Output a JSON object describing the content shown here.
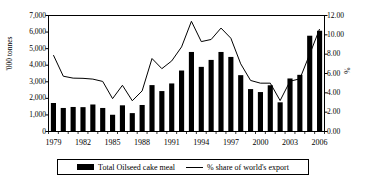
{
  "chart_data": {
    "type": "bar",
    "title": "",
    "subtitle": "",
    "xlabel": "",
    "ylabel": "'000 tonnes",
    "y2label": "%",
    "grid": false,
    "legend_position": "bottom",
    "x": [
      1979,
      1980,
      1981,
      1982,
      1983,
      1984,
      1985,
      1986,
      1987,
      1988,
      1989,
      1990,
      1991,
      1992,
      1993,
      1994,
      1995,
      1996,
      1997,
      1998,
      1999,
      2000,
      2001,
      2002,
      2003,
      2004,
      2005,
      2006
    ],
    "xtick_labels": [
      "1979",
      "1982",
      "1985",
      "1988",
      "1991",
      "1994",
      "1997",
      "2000",
      "2003",
      "2006"
    ],
    "xtick_values": [
      1979,
      1982,
      1985,
      1988,
      1991,
      1994,
      1997,
      2000,
      2003,
      2006
    ],
    "ylim": [
      0,
      7000
    ],
    "ytick_labels": [
      "0",
      "1,000",
      "2,000",
      "3,000",
      "4,000",
      "5,000",
      "6,000",
      "7,000"
    ],
    "ytick_values": [
      0,
      1000,
      2000,
      3000,
      4000,
      5000,
      6000,
      7000
    ],
    "y2lim": [
      0,
      12
    ],
    "y2tick_labels": [
      "0.00",
      "2.00",
      "4.00",
      "6.00",
      "8.00",
      "10.00",
      "12.00"
    ],
    "y2tick_values": [
      0,
      2,
      4,
      6,
      8,
      10,
      12
    ],
    "series": [
      {
        "name": "Total Oilseed cake meal",
        "kind": "bar",
        "axis": "left",
        "color": "#000000",
        "values": [
          1720,
          1420,
          1480,
          1470,
          1630,
          1420,
          1010,
          1580,
          1110,
          1600,
          2800,
          2440,
          2900,
          3680,
          4800,
          3900,
          4320,
          4800,
          4500,
          3400,
          2560,
          2380,
          2790,
          1760,
          3200,
          3420,
          5780,
          6080
        ]
      },
      {
        "name": "% share of world's export",
        "kind": "line",
        "axis": "right",
        "color": "#000000",
        "values": [
          7.9,
          5.72,
          5.52,
          5.5,
          5.42,
          5.18,
          3.4,
          4.78,
          3.18,
          4.2,
          7.55,
          6.5,
          7.3,
          8.75,
          11.4,
          9.3,
          9.52,
          10.7,
          9.65,
          7.0,
          5.28,
          5.0,
          5.0,
          3.2,
          5.2,
          5.45,
          8.0,
          10.6
        ]
      }
    ]
  },
  "legend": {
    "items": [
      {
        "label": "Total Oilseed cake meal",
        "marker": "bar"
      },
      {
        "label": "% share of world's export",
        "marker": "line"
      }
    ]
  }
}
